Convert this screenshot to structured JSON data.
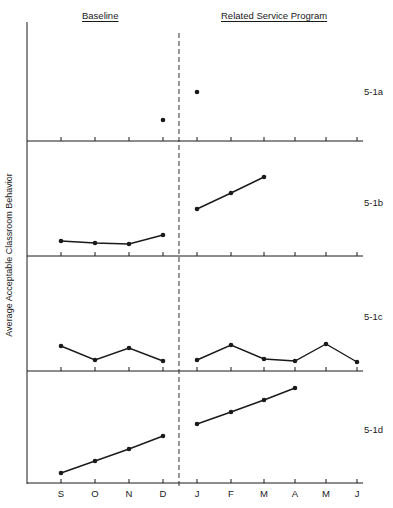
{
  "header": {
    "baseline_label": "Baseline",
    "treatment_label": "Related Service Program"
  },
  "y_axis_label": "Average Acceptable Classroom Behavior",
  "months": [
    "S",
    "O",
    "N",
    "D",
    "J",
    "F",
    "M",
    "A",
    "M",
    "J"
  ],
  "panel_labels": [
    "5-1a",
    "5-1b",
    "5-1c",
    "5-1d"
  ],
  "chart_data": [
    {
      "type": "line",
      "title": "5-1a",
      "categories": [
        "S",
        "O",
        "N",
        "D",
        "J",
        "F",
        "M",
        "A",
        "M",
        "J"
      ],
      "series": [
        {
          "name": "Baseline",
          "x": [
            "D"
          ],
          "values": [
            21
          ]
        },
        {
          "name": "Related Service Program",
          "x": [
            "J"
          ],
          "values": [
            49
          ]
        }
      ],
      "xlabel": "",
      "ylabel": "Average Acceptable Classroom Behavior",
      "phase_line_between": [
        "D",
        "J"
      ],
      "y_units": "relative (no tick values shown)",
      "ylim": [
        0,
        119
      ],
      "grid": false
    },
    {
      "type": "line",
      "title": "5-1b",
      "categories": [
        "S",
        "O",
        "N",
        "D",
        "J",
        "F",
        "M",
        "A",
        "M",
        "J"
      ],
      "series": [
        {
          "name": "Baseline",
          "x": [
            "S",
            "O",
            "N",
            "D"
          ],
          "values": [
            15,
            13,
            12,
            21
          ]
        },
        {
          "name": "Related Service Program",
          "x": [
            "J",
            "F",
            "M"
          ],
          "values": [
            47,
            63,
            79
          ]
        }
      ],
      "xlabel": "",
      "ylabel": "Average Acceptable Classroom Behavior",
      "phase_line_between": [
        "D",
        "J"
      ],
      "y_units": "relative (no tick values shown)",
      "ylim": [
        0,
        115
      ],
      "grid": false
    },
    {
      "type": "line",
      "title": "5-1c",
      "categories": [
        "S",
        "O",
        "N",
        "D",
        "J",
        "F",
        "M",
        "A",
        "M",
        "J"
      ],
      "series": [
        {
          "name": "Baseline",
          "x": [
            "S",
            "O",
            "N",
            "D"
          ],
          "values": [
            25,
            11,
            23,
            10
          ]
        },
        {
          "name": "Related Service Program",
          "x": [
            "J",
            "F",
            "M",
            "A",
            "M",
            "J"
          ],
          "values": [
            11,
            26,
            12,
            10,
            27,
            9
          ]
        }
      ],
      "xlabel": "",
      "ylabel": "Average Acceptable Classroom Behavior",
      "phase_line_between": [
        "D",
        "J"
      ],
      "y_units": "relative (no tick values shown)",
      "ylim": [
        0,
        115
      ],
      "grid": false
    },
    {
      "type": "line",
      "title": "5-1d",
      "categories": [
        "S",
        "O",
        "N",
        "D",
        "J",
        "F",
        "M",
        "A",
        "M",
        "J"
      ],
      "series": [
        {
          "name": "Baseline",
          "x": [
            "S",
            "O",
            "N",
            "D"
          ],
          "values": [
            10,
            22,
            34,
            47
          ]
        },
        {
          "name": "Related Service Program",
          "x": [
            "J",
            "F",
            "M",
            "A"
          ],
          "values": [
            59,
            71,
            83,
            95
          ]
        }
      ],
      "xlabel": "",
      "ylabel": "Average Acceptable Classroom Behavior",
      "phase_line_between": [
        "D",
        "J"
      ],
      "y_units": "relative (no tick values shown)",
      "ylim": [
        0,
        112
      ],
      "grid": false
    }
  ],
  "colors": {
    "ink": "#1a1a1a",
    "background": "#ffffff"
  }
}
